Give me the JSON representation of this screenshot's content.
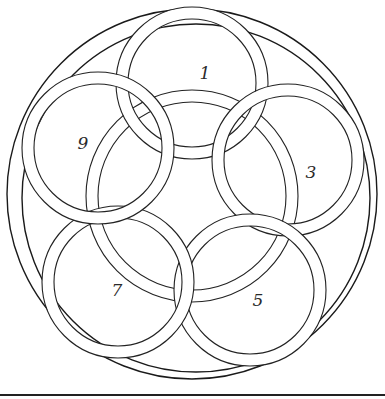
{
  "diagram": {
    "outer_circle": {
      "cx": 192,
      "cy": 194,
      "r": 185
    },
    "outer_inner_arc": {
      "cx": 196,
      "cy": 198,
      "r": 174
    },
    "central_ring": {
      "cx": 192,
      "cy": 196,
      "r_outer": 106,
      "r_inner": 94
    },
    "rings": [
      {
        "id": "ring-1",
        "label": "1",
        "cx": 192,
        "cy": 83,
        "r_outer": 76,
        "r_inner": 64,
        "label_x": 205,
        "label_y": 73
      },
      {
        "id": "ring-3",
        "label": "3",
        "cx": 288,
        "cy": 160,
        "r_outer": 76,
        "r_inner": 64,
        "label_x": 311,
        "label_y": 172
      },
      {
        "id": "ring-5",
        "label": "5",
        "cx": 250,
        "cy": 290,
        "r_outer": 76,
        "r_inner": 64,
        "label_x": 258,
        "label_y": 300
      },
      {
        "id": "ring-7",
        "label": "7",
        "cx": 118,
        "cy": 282,
        "r_outer": 76,
        "r_inner": 64,
        "label_x": 117,
        "label_y": 290
      },
      {
        "id": "ring-9",
        "label": "9",
        "cx": 98,
        "cy": 148,
        "r_outer": 76,
        "r_inner": 64,
        "label_x": 83,
        "label_y": 143
      }
    ],
    "baseline": {
      "y": 394
    },
    "colors": {
      "line": "#222222",
      "background": "#ffffff"
    }
  }
}
